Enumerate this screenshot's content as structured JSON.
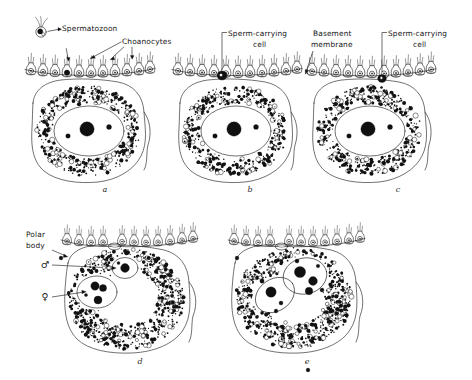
{
  "figure": {
    "title_visible": false,
    "background_color": "#ffffff",
    "ink_color": "#1a1a1a",
    "width": 472,
    "height": 380
  },
  "labels": [
    {
      "id": "spermatozoon",
      "text": "Spermatozoon",
      "x": 62,
      "y": 31,
      "anchor": "start",
      "panel": "a"
    },
    {
      "id": "choanocytes",
      "text": "Choanocytes",
      "x": 122,
      "y": 44,
      "anchor": "start",
      "panel": "a"
    },
    {
      "id": "sperm-carrying-cell-b-1",
      "text": "Sperm-carrying",
      "x": 228,
      "y": 36,
      "anchor": "start",
      "panel": "b"
    },
    {
      "id": "sperm-carrying-cell-b-2",
      "text": "cell",
      "x": 253,
      "y": 47,
      "anchor": "start",
      "panel": "b"
    },
    {
      "id": "basement-membrane-1",
      "text": "Basement",
      "x": 313,
      "y": 36,
      "anchor": "start",
      "panel": "c"
    },
    {
      "id": "basement-membrane-2",
      "text": "membrane",
      "x": 311,
      "y": 47,
      "anchor": "start",
      "panel": "c"
    },
    {
      "id": "sperm-carrying-cell-c-1",
      "text": "Sperm-carrying",
      "x": 388,
      "y": 36,
      "anchor": "start",
      "panel": "c"
    },
    {
      "id": "sperm-carrying-cell-c-2",
      "text": "cell",
      "x": 413,
      "y": 47,
      "anchor": "start",
      "panel": "c"
    },
    {
      "id": "polar-body-1",
      "text": "Polar",
      "x": 26,
      "y": 237,
      "anchor": "start",
      "panel": "d"
    },
    {
      "id": "polar-body-2",
      "text": "body",
      "x": 26,
      "y": 248,
      "anchor": "start",
      "panel": "d"
    }
  ],
  "symbols": [
    {
      "id": "male-symbol",
      "glyph": "♂",
      "x": 45,
      "y": 268,
      "panel": "d",
      "meaning": "male pronucleus"
    },
    {
      "id": "female-symbol",
      "glyph": "♀",
      "x": 45,
      "y": 300,
      "panel": "d",
      "meaning": "female pronucleus"
    }
  ],
  "panel_letters": [
    {
      "id": "panel-a",
      "text": "a",
      "x": 105,
      "y": 192
    },
    {
      "id": "panel-b",
      "text": "b",
      "x": 250,
      "y": 192
    },
    {
      "id": "panel-c",
      "text": "c",
      "x": 398,
      "y": 192
    },
    {
      "id": "panel-d",
      "text": "d",
      "x": 140,
      "y": 364
    },
    {
      "id": "panel-e",
      "text": "e",
      "x": 307,
      "y": 364
    }
  ],
  "panels": [
    {
      "id": "a",
      "caption_letter": "a",
      "description": "Spermatozoon approaching choanocyte layer above the egg"
    },
    {
      "id": "b",
      "caption_letter": "b",
      "description": "Sperm-carrying cell formed within the epithelium"
    },
    {
      "id": "c",
      "caption_letter": "c",
      "description": "Sperm-carrying cell penetrating basement membrane toward the egg"
    },
    {
      "id": "d",
      "caption_letter": "d",
      "description": "Male and female pronuclei inside the egg, polar body extruded"
    },
    {
      "id": "e",
      "caption_letter": "e",
      "description": "Pronuclei in contact just before fusion"
    }
  ]
}
